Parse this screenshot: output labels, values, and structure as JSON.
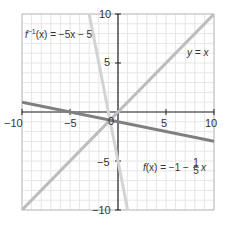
{
  "chart_data": {
    "type": "line",
    "title": "",
    "xlabel": "",
    "ylabel": "",
    "xlim": [
      -10,
      10
    ],
    "ylim": [
      -10,
      10
    ],
    "grid": true,
    "grid_minor_step": 1,
    "x_ticks": [
      -10,
      -5,
      0,
      5,
      10
    ],
    "y_ticks": [
      -10,
      -5,
      5,
      10
    ],
    "x_tick_labels": [
      "−10",
      "−5",
      "0",
      "5",
      "10"
    ],
    "y_tick_labels": [
      "−10",
      "−5",
      "5",
      "10"
    ],
    "origin_label": "0",
    "series": [
      {
        "name": "y = x",
        "equation": "y = x",
        "color": "#bdbdbd",
        "points": [
          [
            -10,
            -10
          ],
          [
            10,
            10
          ]
        ]
      },
      {
        "name": "f⁻¹(x) = −5x − 5",
        "equation": "f^-1(x) = -5x - 5",
        "color": "#d3d3d3",
        "points": [
          [
            -3,
            10
          ],
          [
            1,
            -10
          ]
        ]
      },
      {
        "name": "f(x) = −1 − (1/5)x",
        "equation": "f(x) = -1 - x/5",
        "color": "#7f7f7f",
        "points": [
          [
            -10,
            1
          ],
          [
            10,
            -3
          ]
        ]
      }
    ],
    "annotations": [
      {
        "text": "f⁻¹(x) = −5x − 5",
        "x": -9.6,
        "y": 7.9
      },
      {
        "text": "y = x",
        "x": 6.2,
        "y": 5.8
      },
      {
        "text": "f(x) = −1 − ⅕x",
        "x": 3.0,
        "y": -6.0
      }
    ]
  },
  "labels": {
    "finv_prefix": "f",
    "finv_sup": "−1",
    "finv_body": "(x) = −5x − 5",
    "yx": "y = x",
    "f_prefix": "f",
    "f_body": "(x) = −1 − ",
    "f_frac_num": "1",
    "f_frac_den": "5",
    "f_tail": "x",
    "tick_x_m10": "−10",
    "tick_x_m5": "−5",
    "tick_x_0": "0",
    "tick_x_5": "5",
    "tick_x_10": "10",
    "tick_y_10": "10",
    "tick_y_5": "5",
    "tick_y_m5": "−5",
    "tick_y_m10": "−10"
  }
}
